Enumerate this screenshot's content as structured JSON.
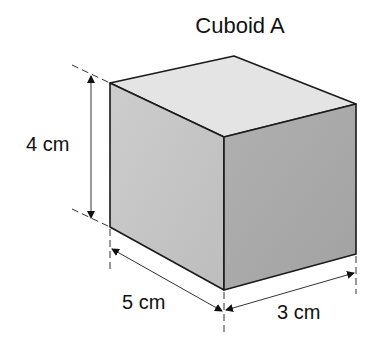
{
  "title": "Cuboid A",
  "dimensions": {
    "height": {
      "value": 4,
      "unit": "cm",
      "label": "4 cm"
    },
    "length": {
      "value": 5,
      "unit": "cm",
      "label": "5 cm"
    },
    "width": {
      "value": 3,
      "unit": "cm",
      "label": "3 cm"
    }
  },
  "colors": {
    "top_face": "#e3e3e3",
    "left_face": "#c4c4c4",
    "right_face": "#a9a9a9",
    "edge": "#1a1a1a"
  }
}
